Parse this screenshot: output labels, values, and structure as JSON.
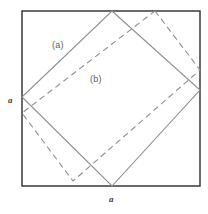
{
  "figure": {
    "colors": {
      "background": "#ffffff",
      "outer_frame": "#2b2b2b",
      "solid_square": "#8a8f94",
      "dashed_square": "#8a8f94",
      "label_text": "#555a5e",
      "dimension_text": "#3a3a3a"
    },
    "outer_square": {
      "name": "outer-square",
      "side_label": "a",
      "x": 22,
      "y": 11,
      "width": 178,
      "height": 175,
      "stroke_width": 1.4,
      "style": "solid"
    },
    "shapes": [
      {
        "id": "shape-a",
        "label": "(a)",
        "style": "solid",
        "stroke_width": 1.1,
        "points": "112,11 200,90 112,186 22,97"
      },
      {
        "id": "shape-b",
        "label": "(b)",
        "style": "dashed",
        "stroke_width": 1.1,
        "dash_pattern": "6,4",
        "points": "155,11 200,70 73,181 22,113"
      }
    ],
    "dimensions": [
      {
        "id": "dim-left",
        "text": "a",
        "position": "left-edge-midpoint"
      },
      {
        "id": "dim-bottom",
        "text": "a",
        "position": "bottom-edge-midpoint"
      }
    ]
  }
}
